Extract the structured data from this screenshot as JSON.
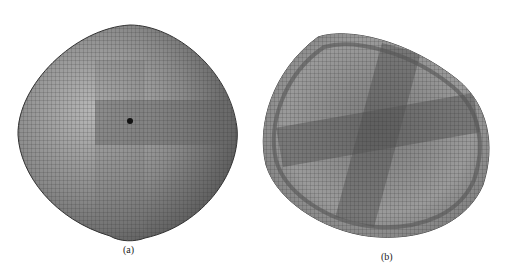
{
  "figure": {
    "panels": [
      {
        "id": "a",
        "label": "(a)",
        "description": "Inflated mesh shell, convex top view"
      },
      {
        "id": "b",
        "label": "(b)",
        "description": "Deformed mesh shell, concave view with rim"
      }
    ],
    "colors": {
      "mesh_fill": "#8c8c8c",
      "mesh_dark": "#5a5a5a",
      "mesh_light": "#c8c8c8",
      "grid_line": "#3a3a3a",
      "background": "#ffffff"
    }
  }
}
